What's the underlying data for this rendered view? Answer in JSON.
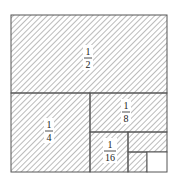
{
  "diagram": {
    "title": "",
    "colors": {
      "line": "#555555",
      "hatch": "#777777",
      "background": "#ffffff",
      "unshaded": "#ffffff"
    },
    "regions": [
      {
        "id": "half",
        "numerator": "1",
        "denominator": "2",
        "shaded": true
      },
      {
        "id": "quarter",
        "numerator": "1",
        "denominator": "4",
        "shaded": true
      },
      {
        "id": "eighth",
        "numerator": "1",
        "denominator": "8",
        "shaded": true
      },
      {
        "id": "sixteenth",
        "numerator": "1",
        "denominator": "16",
        "shaded": true
      },
      {
        "id": "thirty-second",
        "shaded": true
      },
      {
        "id": "sixty-fourth",
        "shaded": true
      },
      {
        "id": "remainder",
        "shaded": false
      }
    ]
  }
}
